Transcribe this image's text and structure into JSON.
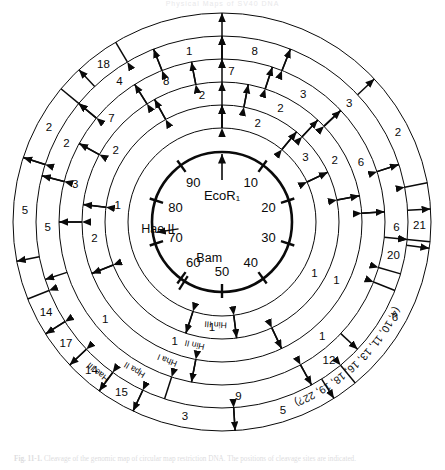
{
  "header": {
    "title": "Physical Maps of SV40 DNA"
  },
  "caption": {
    "label": "Fig. 11-1.",
    "text": "Cleavage of the genomic map of circular map restriction DNA. The positions of cleavage sites are indicated."
  },
  "figure": {
    "center_enzyme": "EcoR₁",
    "scale_ticks": [
      "10",
      "20",
      "30",
      "40",
      "50",
      "60",
      "70",
      "80",
      "90"
    ],
    "inner_site_labels": [
      {
        "name": "Hae II",
        "position_pct": 72.5
      },
      {
        "name": "Bam",
        "position_pct": 59.0
      }
    ],
    "rings": [
      {
        "index": 0,
        "enzyme": "Hin III",
        "fragments": [
          {
            "label": "1",
            "start_pct": 55.0,
            "span_pct": 45.0
          },
          {
            "label": "2",
            "start_pct": 0.0,
            "span_pct": 11.0
          },
          {
            "label": "3",
            "start_pct": 11.0,
            "span_pct": 7.0
          },
          {
            "label": "1",
            "start_pct": 18.0,
            "span_pct": 30.0
          },
          {
            "label": "1",
            "start_pct": 48.0,
            "span_pct": 7.0
          }
        ]
      },
      {
        "index": 1,
        "enzyme": "Hin II",
        "fragments": [
          {
            "label": "2",
            "start_pct": 92.0,
            "span_pct": 11.0
          },
          {
            "label": "2",
            "start_pct": 3.0,
            "span_pct": 9.0
          },
          {
            "label": "2",
            "start_pct": 12.0,
            "span_pct": 10.0
          },
          {
            "label": "1",
            "start_pct": 22.0,
            "span_pct": 21.0
          },
          {
            "label": "1",
            "start_pct": 43.0,
            "span_pct": 26.0
          },
          {
            "label": "2",
            "start_pct": 69.0,
            "span_pct": 8.0
          },
          {
            "label": "2",
            "start_pct": 77.0,
            "span_pct": 15.0
          }
        ]
      },
      {
        "index": 2,
        "enzyme": "Hha I",
        "fragments": [
          {
            "label": "7",
            "start_pct": 97.0,
            "span_pct": 8.0
          },
          {
            "label": "3",
            "start_pct": 5.0,
            "span_pct": 8.0
          },
          {
            "label": "6",
            "start_pct": 13.0,
            "span_pct": 11.0
          },
          {
            "label": "1",
            "start_pct": 24.0,
            "span_pct": 29.0
          },
          {
            "label": "1",
            "start_pct": 53.0,
            "span_pct": 22.0
          },
          {
            "label": "3",
            "start_pct": 75.0,
            "span_pct": 8.0
          },
          {
            "label": "7",
            "start_pct": 83.0,
            "span_pct": 8.0
          },
          {
            "label": "8",
            "start_pct": 91.0,
            "span_pct": 6.0
          }
        ]
      },
      {
        "index": 3,
        "enzyme": "Hpa II",
        "fragments": [
          {
            "label": "8",
            "start_pct": 0.0,
            "span_pct": 6.0
          },
          {
            "label": "3",
            "start_pct": 6.0,
            "span_pct": 14.0
          },
          {
            "label": "6",
            "start_pct": 20.0,
            "span_pct": 11.0
          },
          {
            "label": "20",
            "start_pct": 26.5,
            "span_pct": 3.0
          },
          {
            "label": "9",
            "start_pct": 42.0,
            "span_pct": 13.0
          },
          {
            "label": "12",
            "start_pct": 37.0,
            "span_pct": 5.0
          },
          {
            "label": "5",
            "start_pct": 70.0,
            "span_pct": 9.0
          },
          {
            "label": "2",
            "start_pct": 79.0,
            "span_pct": 7.0
          },
          {
            "label": "4",
            "start_pct": 86.0,
            "span_pct": 8.0
          },
          {
            "label": "1",
            "start_pct": 94.0,
            "span_pct": 6.0
          }
        ]
      },
      {
        "index": 4,
        "enzyme": "Hae III",
        "fragments": [
          {
            "label": "18",
            "start_pct": 88.0,
            "span_pct": 3.5
          },
          {
            "label": "2",
            "start_pct": 80.0,
            "span_pct": 6.0
          },
          {
            "label": "5",
            "start_pct": 72.0,
            "span_pct": 8.0
          },
          {
            "label": "14",
            "start_pct": 66.0,
            "span_pct": 3.0
          },
          {
            "label": "17",
            "start_pct": 63.0,
            "span_pct": 3.0
          },
          {
            "label": "14",
            "start_pct": 60.0,
            "span_pct": 3.0
          },
          {
            "label": "15",
            "start_pct": 57.0,
            "span_pct": 3.0
          },
          {
            "label": "3",
            "start_pct": 49.0,
            "span_pct": 8.0
          },
          {
            "label": "5",
            "start_pct": 41.0,
            "span_pct": 8.0
          },
          {
            "label": "21",
            "start_pct": 24.0,
            "span_pct": 2.5
          },
          {
            "label": "6",
            "start_pct": 27.0,
            "span_pct": 12.0
          },
          {
            "label": "2",
            "start_pct": 13.0,
            "span_pct": 9.0
          }
        ]
      }
    ],
    "bottom_right_note": "(4, 10, 11, 13, 16, 18, 19, 22?)",
    "ring_enzyme_labels": [
      "Hin III",
      "Hin II",
      "Hha I",
      "Hpa II",
      "Hae III"
    ],
    "colors": {
      "line": "#0a0a0a",
      "background": "#ffffff"
    }
  }
}
